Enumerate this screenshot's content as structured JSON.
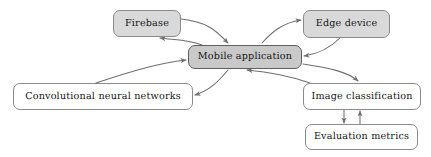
{
  "diagram": {
    "background_color": "#ffffff",
    "edge_color": "#6e6e6e",
    "nodes": [
      {
        "id": "firebase",
        "label": "Firebase",
        "fill": "#d9d9d9",
        "border": "#8a8a8a",
        "x": 113,
        "y": 10,
        "w": 68,
        "h": 27,
        "font_size": 9.6
      },
      {
        "id": "edge_device",
        "label": "Edge device",
        "fill": "#d9d9d9",
        "border": "#8a8a8a",
        "x": 303,
        "y": 10,
        "w": 87,
        "h": 28,
        "font_size": 9.6
      },
      {
        "id": "mobile_application",
        "label": "Mobile application",
        "fill": "#c9c9c9",
        "border": "#5f5f5f",
        "x": 188,
        "y": 45,
        "w": 114,
        "h": 24,
        "font_size": 9.6
      },
      {
        "id": "convolutional_neural_networks",
        "label": "Convolutional neural networks",
        "fill": "#ffffff",
        "border": "#8a8a8a",
        "x": 13,
        "y": 83,
        "w": 180,
        "h": 27,
        "font_size": 9.6
      },
      {
        "id": "image_classification",
        "label": "Image classification",
        "fill": "#ffffff",
        "border": "#8a8a8a",
        "x": 303,
        "y": 83,
        "w": 118,
        "h": 27,
        "font_size": 9.6
      },
      {
        "id": "evaluation_metrics",
        "label": "Evaluation metrics",
        "fill": "#ffffff",
        "border": "#8a8a8a",
        "x": 305,
        "y": 124,
        "w": 113,
        "h": 26,
        "font_size": 9.6
      }
    ],
    "edges": [
      {
        "id": "firebase-to-mobile",
        "from": "firebase",
        "to": "mobile_application",
        "path": "M 181 19 C 210 22 218 33 228 43",
        "arrow_at": [
          228,
          44
        ]
      },
      {
        "id": "mobile-to-firebase",
        "from": "mobile_application",
        "to": "firebase",
        "path": "M 202 45 C 190 40 176 40 160 38",
        "arrow_at": [
          159,
          38
        ]
      },
      {
        "id": "mobile-to-edge",
        "from": "mobile_application",
        "to": "edge_device",
        "path": "M 262 43 C 272 32 282 23 301 20",
        "arrow_at": [
          302,
          20
        ]
      },
      {
        "id": "edge-to-mobile",
        "from": "edge_device",
        "to": "mobile_application",
        "path": "M 340 38 C 330 48 318 54 304 56",
        "arrow_at": [
          303,
          56
        ]
      },
      {
        "id": "cnn-to-mobile",
        "from": "convolutional_neural_networks",
        "to": "mobile_application",
        "path": "M 96 83 C 135 70 160 63 186 60",
        "arrow_at": [
          187,
          60
        ]
      },
      {
        "id": "mobile-to-cnn",
        "from": "mobile_application",
        "to": "convolutional_neural_networks",
        "path": "M 228 70 C 218 82 210 90 195 95",
        "arrow_at": [
          194,
          95
        ]
      },
      {
        "id": "mobile-to-image",
        "from": "mobile_application",
        "to": "image_classification",
        "path": "M 303 64 C 330 68 348 72 358 81",
        "arrow_at": [
          359,
          82
        ]
      },
      {
        "id": "image-to-mobile",
        "from": "image_classification",
        "to": "mobile_application",
        "path": "M 310 83 C 290 76 270 72 247 70",
        "arrow_at": [
          246,
          70
        ]
      },
      {
        "id": "image-to-evaluation",
        "from": "image_classification",
        "to": "evaluation_metrics",
        "path": "M 344 110 L 344 123",
        "arrow_at": [
          344,
          124
        ]
      },
      {
        "id": "evaluation-to-image",
        "from": "evaluation_metrics",
        "to": "image_classification",
        "path": "M 360 124 L 360 111",
        "arrow_at": [
          360,
          110
        ]
      }
    ]
  }
}
